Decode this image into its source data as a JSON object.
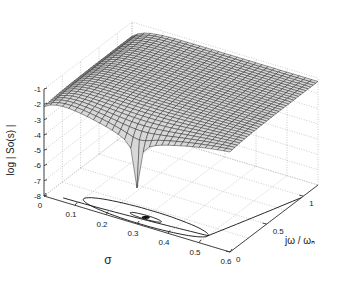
{
  "chart_data": {
    "type": "surface3d",
    "title": "",
    "xlabel": "σ",
    "ylabel": "jω / ωₙ",
    "zlabel": "log | So(s) |",
    "x_ticks": [
      "0",
      "0.1",
      "0.2",
      "0.3",
      "0.4",
      "0.5",
      "0.6"
    ],
    "y_ticks": [
      "0",
      "0.5",
      "1"
    ],
    "z_ticks": [
      "-1",
      "-2",
      "-3",
      "-4",
      "-5",
      "-6",
      "-7",
      "-8"
    ],
    "xlim": [
      0,
      0.6
    ],
    "ylim": [
      0,
      1.2
    ],
    "zlim": [
      -8,
      -1
    ],
    "grid": true,
    "surface": {
      "description": "Mesh of log|So(s)| over σ∈[0,0.6], jω/ωn∈[0,1.2]; flat plateau near -1 to -2 with a sharp notch (minimum ≈ -8) near σ≈0.3, jω/ωn≈0",
      "plateau_level": -1.2,
      "edge_level_at_sigma0": -1.9,
      "notch_center": {
        "sigma": 0.3,
        "jw": 0.0
      },
      "notch_min": -7.6
    },
    "contours_on_floor": [
      {
        "type": "ellipse",
        "center_sigma": 0.3,
        "rx_sigma": 0.2,
        "ry_jw": 0.12
      },
      {
        "type": "ellipse",
        "center_sigma": 0.3,
        "rx_sigma": 0.05,
        "ry_jw": 0.03
      },
      {
        "type": "curve",
        "description": "S-shaped curve from σ≈0.05 along floor to σ≈0.6, jω≈0.9"
      }
    ]
  }
}
